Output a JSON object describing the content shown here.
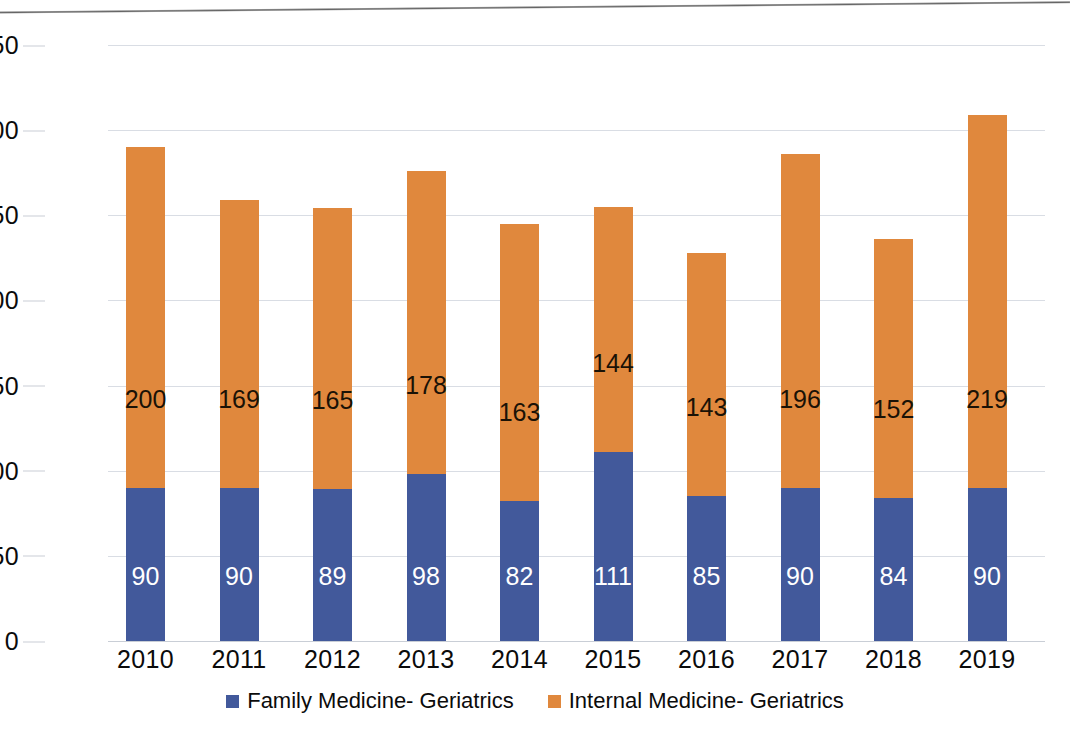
{
  "chart_data": {
    "type": "bar",
    "subtype": "stacked-bar",
    "title": "",
    "xlabel": "",
    "ylabel": "",
    "categories": [
      "2010",
      "2011",
      "2012",
      "2013",
      "2014",
      "2015",
      "2016",
      "2017",
      "2018",
      "2019"
    ],
    "series": [
      {
        "name": "Family Medicine- Geriatrics",
        "color": "#42599b",
        "values": [
          90,
          90,
          89,
          98,
          82,
          111,
          85,
          90,
          84,
          90
        ]
      },
      {
        "name": "Internal Medicine- Geriatrics",
        "color": "#e0883d",
        "values": [
          200,
          169,
          165,
          178,
          163,
          144,
          143,
          196,
          152,
          219
        ]
      }
    ],
    "totals": [
      290,
      259,
      254,
      276,
      245,
      255,
      228,
      286,
      236,
      309
    ],
    "ylim": [
      0,
      350
    ],
    "yticks": [
      "0",
      "50",
      "100",
      "150",
      "200",
      "250",
      "300",
      "350"
    ],
    "ytick_values": [
      0,
      50,
      100,
      150,
      200,
      250,
      300,
      350
    ],
    "grid": true,
    "legend_position": "bottom"
  },
  "legend": {
    "items": [
      {
        "label": "Family Medicine- Geriatrics",
        "color": "#42599b"
      },
      {
        "label": "Internal Medicine- Geriatrics",
        "color": "#e0883d"
      }
    ]
  },
  "colors": {
    "series_blue": "#42599b",
    "series_orange": "#e0883d",
    "gridline": "#d9dde4",
    "axis_text": "#0b0b0b",
    "background": "#ffffff"
  }
}
